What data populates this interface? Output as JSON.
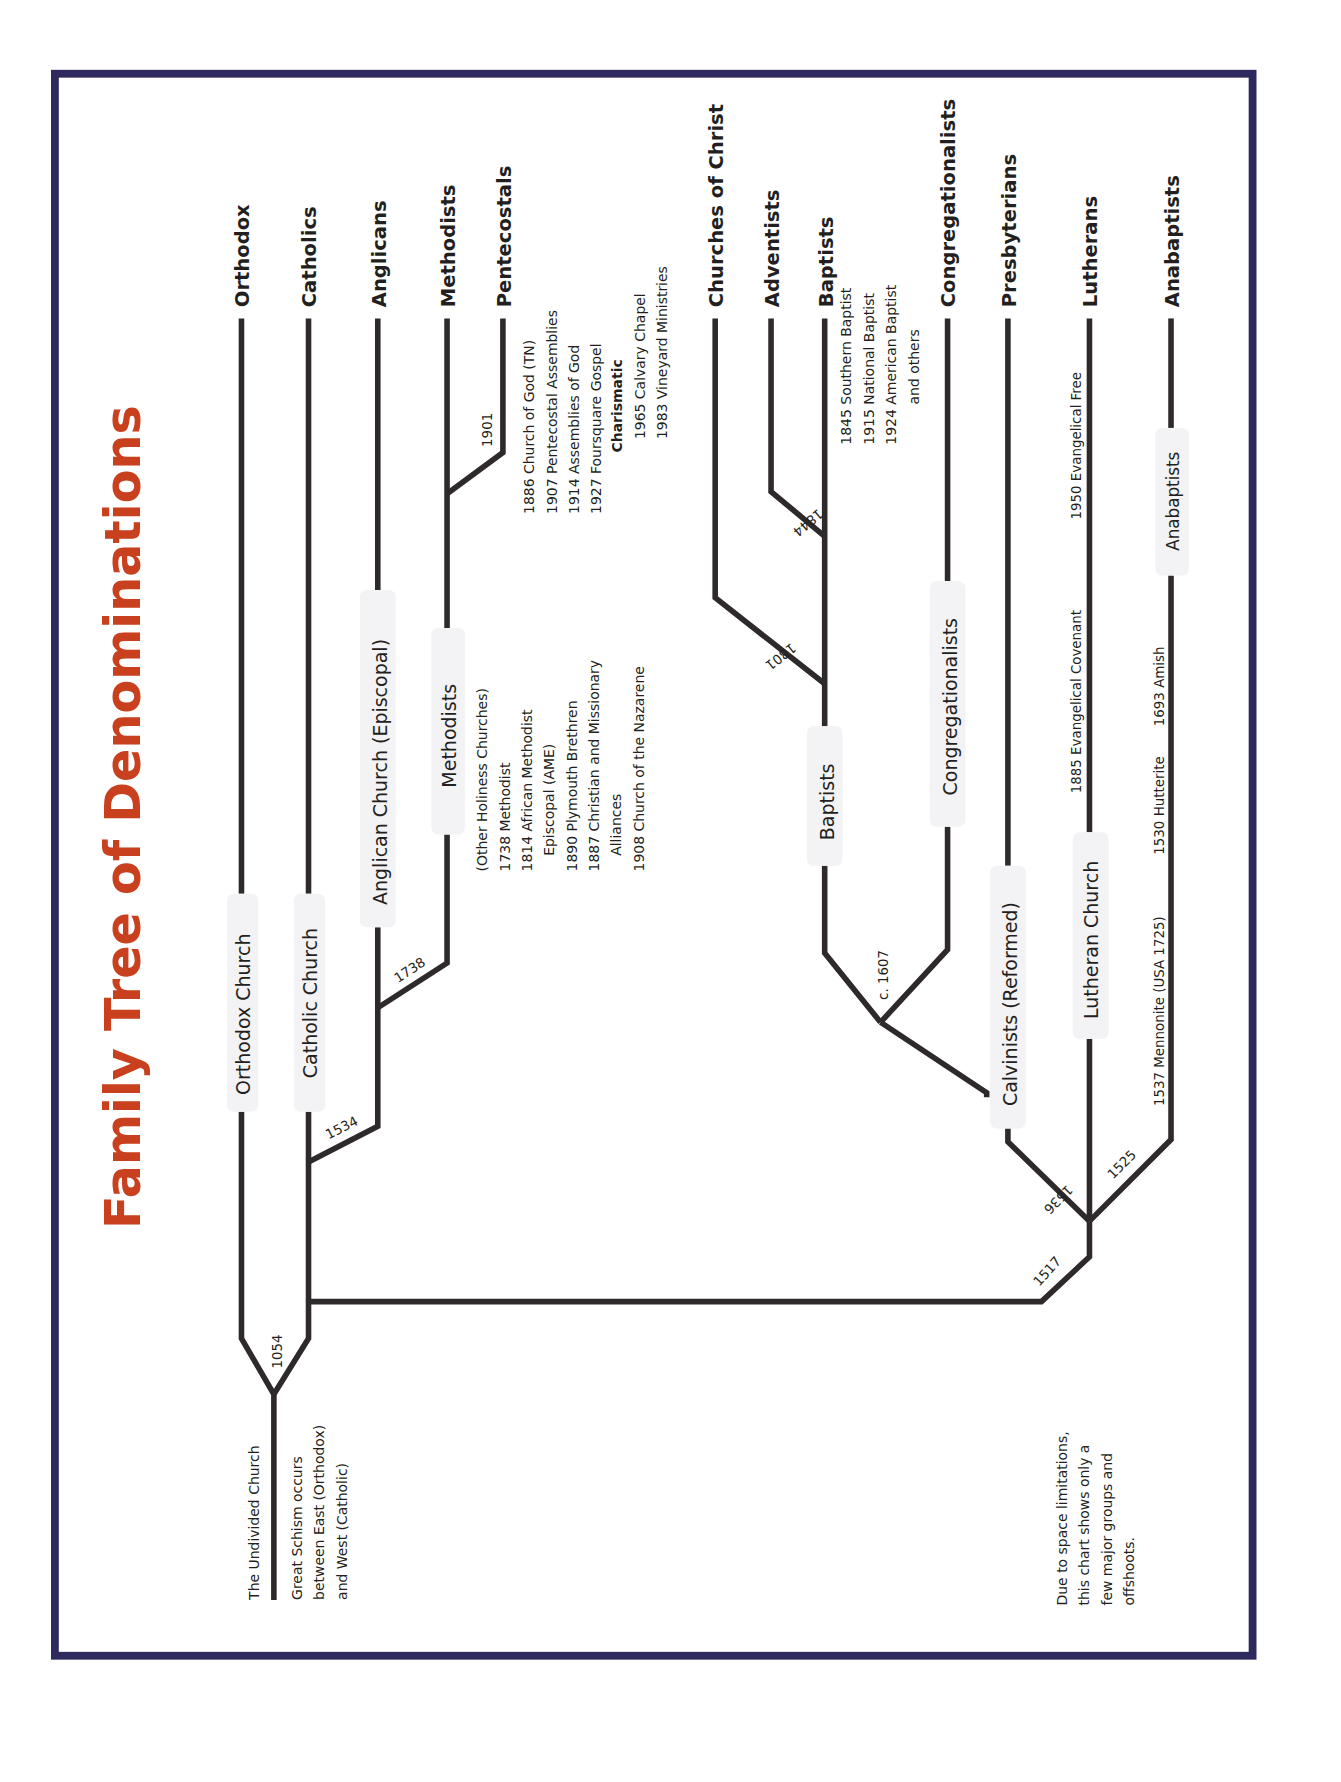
{
  "title": "Family Tree of Denominations",
  "colors": {
    "title": "#c8401e",
    "border": "#2e2a5e",
    "line": "#2e2a2b"
  },
  "root": {
    "label": "The Undivided Church",
    "note": [
      "Great Schism occurs",
      "between East (Orthodox)",
      "and West (Catholic)"
    ]
  },
  "footnote": [
    "Due to space limitations,",
    "this chart shows only a",
    "few major groups and",
    "offshoots."
  ],
  "branches": {
    "orthodox": {
      "church": "Orthodox Church",
      "end": "Orthodox"
    },
    "catholic": {
      "church": "Catholic Church",
      "end": "Catholics"
    },
    "anglican": {
      "church": "Anglican Church (Episcopal)",
      "end": "Anglicans"
    },
    "methodist": {
      "church": "Methodists",
      "end": "Methodists",
      "offshoots": [
        "(Other Holiness Churches)",
        "1738 Methodist",
        "1814 African Methodist",
        "Episcopal (AME)",
        "1890 Plymouth Brethren",
        "1887 Christian and Missionary",
        "Alliances",
        "1908 Church of the Nazarene"
      ]
    },
    "pentecostal": {
      "end": "Pentecostals",
      "offshoots": [
        "1886 Church of God (TN)",
        "1907 Pentecostal Assemblies",
        "1914 Assemblies of God",
        "1927 Foursquare Gospel"
      ],
      "charismatic_label": "Charismatic",
      "charismatic": [
        "1965 Calvary Chapel",
        "1983 Vineyard Ministries"
      ]
    },
    "churches_of_christ": {
      "end": "Churches of Christ"
    },
    "adventist": {
      "end": "Adventists"
    },
    "baptist": {
      "church": "Baptists",
      "end": "Baptists",
      "offshoots": [
        "1845 Southern Baptist",
        "1915 National Baptist",
        "1924 American Baptist",
        "and others"
      ]
    },
    "congregationalist": {
      "church": "Congregationalists",
      "end": "Congregationalists"
    },
    "presbyterian": {
      "church": "Calvinists (Reformed)",
      "end": "Presbyterians"
    },
    "lutheran": {
      "church": "Lutheran Church",
      "end": "Lutherans",
      "offshoots": [
        "1885 Evangelical Covenant",
        "1950 Evangelical Free"
      ]
    },
    "anabaptist": {
      "church": "Anabaptists",
      "end": "Anabaptists",
      "offshoots": [
        "1537 Mennonite (USA 1725)",
        "1530 Hutterite",
        "1693 Amish"
      ]
    }
  },
  "years": {
    "schism": "1054",
    "anglican": "1534",
    "methodist": "1738",
    "pentecostal": "1901",
    "reformation": "1517",
    "calvinist": "1536",
    "anabaptist": "1525",
    "baptist": "c. 1607",
    "churches_of_christ": "1801",
    "adventist": "1844"
  }
}
